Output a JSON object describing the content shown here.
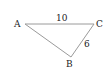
{
  "diagram": {
    "type": "triangle",
    "colors": {
      "edge": "#9a9a9a",
      "text": "#222222",
      "background": "#ffffff"
    },
    "vertices": [
      {
        "id": "A",
        "label": "A",
        "x": 25,
        "y": 24
      },
      {
        "id": "C",
        "label": "C",
        "x": 94,
        "y": 24
      },
      {
        "id": "B",
        "label": "B",
        "x": 71,
        "y": 57
      }
    ],
    "edges": [
      {
        "from": "A",
        "to": "C",
        "label": "10"
      },
      {
        "from": "C",
        "to": "B",
        "label": "6"
      },
      {
        "from": "A",
        "to": "B",
        "label": ""
      }
    ]
  }
}
